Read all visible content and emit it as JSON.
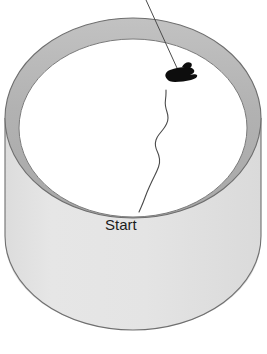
{
  "figure": {
    "caption_label": "Start",
    "background_color": "#ffffff"
  },
  "arena": {
    "name": "cylinder",
    "rim_color": "#b4b4b4",
    "rim_outline_color": "#6e6e6e",
    "interior_floor_color": "#ffffff",
    "inner_wall_color": "#b9b9b9",
    "outer_body_color": "#e3e3e3",
    "body_outline_color": "#6f6f6f",
    "top_ellipse": {
      "center_x": 133,
      "center_y": 118,
      "radius_x": 128,
      "radius_y": 100
    },
    "inner_ellipse": {
      "center_x": 133,
      "center_y": 128,
      "radius_x": 114,
      "radius_y": 89
    },
    "bottom_ellipse": {
      "center_x": 133,
      "center_y": 268,
      "radius_x": 108,
      "radius_y": 84
    }
  },
  "trajectory": {
    "name": "animal-path",
    "stroke_color": "#4a4a4a",
    "stroke_width": 1.1,
    "start_point": {
      "x": 139,
      "y": 212
    },
    "end_point": {
      "x": 166,
      "y": 90
    },
    "points": [
      {
        "x": 139,
        "y": 212
      },
      {
        "x": 143,
        "y": 203
      },
      {
        "x": 147,
        "y": 192
      },
      {
        "x": 152,
        "y": 181
      },
      {
        "x": 157,
        "y": 171
      },
      {
        "x": 160,
        "y": 163
      },
      {
        "x": 159,
        "y": 155
      },
      {
        "x": 156,
        "y": 149
      },
      {
        "x": 155,
        "y": 143
      },
      {
        "x": 157,
        "y": 137
      },
      {
        "x": 161,
        "y": 132
      },
      {
        "x": 165,
        "y": 127
      },
      {
        "x": 168,
        "y": 121
      },
      {
        "x": 168,
        "y": 115
      },
      {
        "x": 166,
        "y": 109
      },
      {
        "x": 165,
        "y": 103
      },
      {
        "x": 166,
        "y": 96
      },
      {
        "x": 166,
        "y": 90
      }
    ]
  },
  "animal": {
    "name": "insect-silhouette",
    "fill_color": "#0d0d0d",
    "position": {
      "x": 180,
      "y": 73
    }
  },
  "leader_line": {
    "name": "pointer-line",
    "stroke_color": "#4a4a4a",
    "stroke_width": 1,
    "from": {
      "x": 146,
      "y": 0
    },
    "to": {
      "x": 177,
      "y": 68
    }
  },
  "labels": {
    "start": {
      "text": "Start",
      "x": 105,
      "y": 230,
      "color": "#1c1c1c",
      "font_size": 15
    }
  }
}
